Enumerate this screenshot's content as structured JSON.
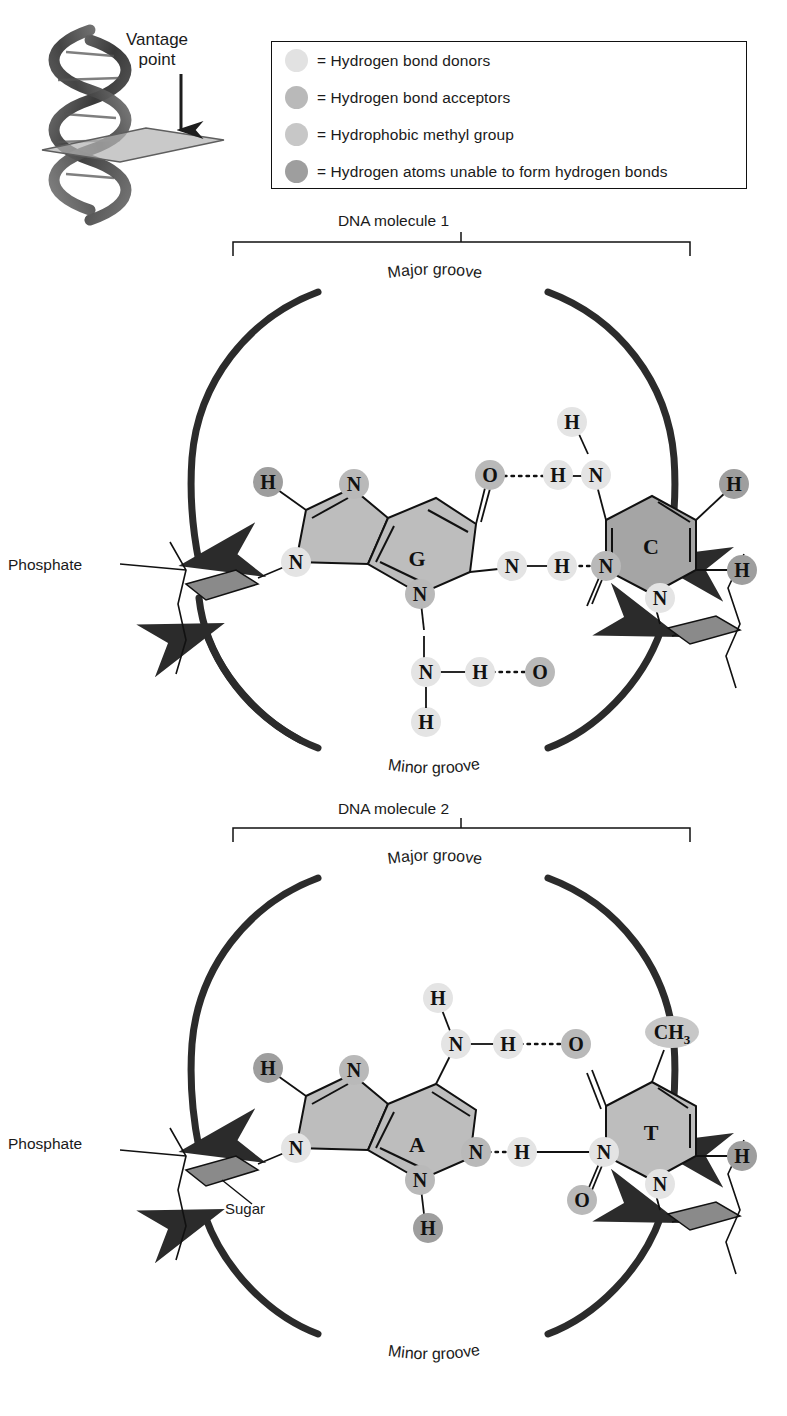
{
  "figure": {
    "type": "dna-base-pair-groove-diagram",
    "background": "#ffffff"
  },
  "vantage": {
    "label_line1": "Vantage",
    "label_line2": "point",
    "icon": "down-arrow-icon",
    "helix_icon": "dna-double-helix-icon",
    "plane_icon": "cross-section-plane-icon"
  },
  "legend": {
    "items": [
      {
        "label": "= Hydrogen bond donors",
        "color": "#e2e2e2",
        "name": "hydrogen-bond-donors"
      },
      {
        "label": "= Hydrogen bond acceptors",
        "color": "#b9b9b9",
        "name": "hydrogen-bond-acceptors"
      },
      {
        "label": "= Hydrophobic methyl group",
        "color": "#c7c7c7",
        "name": "hydrophobic-methyl-group"
      },
      {
        "label": "= Hydrogen atoms unable to form hydrogen bonds",
        "color": "#9e9e9e",
        "name": "hydrogen-atoms-no-bonds"
      }
    ]
  },
  "colors": {
    "donor": "#e4e4e4",
    "acceptor": "#b9b9b9",
    "methyl": "#c7c7c7",
    "nonbonding_h": "#9e9e9e",
    "purine_fill": "#bdbdbd",
    "pyrimidine_c_fill": "#a5a5a5",
    "pyrimidine_t_fill": "#bdbdbd",
    "sugar_fill": "#8a8a8a",
    "stroke": "#111111",
    "arrow": "#2b2b2b"
  },
  "molecules": [
    {
      "title": "DNA molecule 1",
      "major_groove_label": "Major groove",
      "minor_groove_label": "Minor groove",
      "phosphate_label": "Phosphate",
      "sugar_label": "",
      "base_pair": {
        "purine": {
          "letter": "G",
          "name": "guanine"
        },
        "pyrimidine": {
          "letter": "C",
          "name": "cytosine"
        },
        "hydrogen_bonds": 3
      },
      "atoms": [
        {
          "text": "H",
          "kind": "nonbonding_h"
        },
        {
          "text": "N",
          "kind": "acceptor"
        },
        {
          "text": "N",
          "kind": "donor"
        },
        {
          "text": "N",
          "kind": "acceptor"
        },
        {
          "text": "O",
          "kind": "acceptor"
        },
        {
          "text": "N",
          "kind": "donor"
        },
        {
          "text": "H",
          "kind": "donor"
        },
        {
          "text": "N",
          "kind": "donor"
        },
        {
          "text": "H",
          "kind": "donor"
        },
        {
          "text": "N",
          "kind": "acceptor"
        },
        {
          "text": "H",
          "kind": "nonbonding_h"
        },
        {
          "text": "H",
          "kind": "nonbonding_h"
        },
        {
          "text": "N",
          "kind": "donor"
        },
        {
          "text": "H",
          "kind": "donor"
        },
        {
          "text": "O",
          "kind": "acceptor"
        },
        {
          "text": "N",
          "kind": "donor"
        },
        {
          "text": "H",
          "kind": "donor"
        }
      ]
    },
    {
      "title": "DNA molecule 2",
      "major_groove_label": "Major groove",
      "minor_groove_label": "Minor groove",
      "phosphate_label": "Phosphate",
      "sugar_label": "Sugar",
      "base_pair": {
        "purine": {
          "letter": "A",
          "name": "adenine"
        },
        "pyrimidine": {
          "letter": "T",
          "name": "thymine"
        },
        "hydrogen_bonds": 2
      },
      "atoms": [
        {
          "text": "H",
          "kind": "nonbonding_h"
        },
        {
          "text": "N",
          "kind": "acceptor"
        },
        {
          "text": "N",
          "kind": "donor"
        },
        {
          "text": "N",
          "kind": "acceptor"
        },
        {
          "text": "H",
          "kind": "donor"
        },
        {
          "text": "N",
          "kind": "donor"
        },
        {
          "text": "H",
          "kind": "donor"
        },
        {
          "text": "O",
          "kind": "acceptor"
        },
        {
          "text": "N",
          "kind": "acceptor"
        },
        {
          "text": "H",
          "kind": "donor"
        },
        {
          "text": "N",
          "kind": "donor"
        },
        {
          "text": "CH3",
          "kind": "methyl"
        },
        {
          "text": "H",
          "kind": "nonbonding_h"
        },
        {
          "text": "H",
          "kind": "nonbonding_h"
        },
        {
          "text": "O",
          "kind": "acceptor"
        },
        {
          "text": "N",
          "kind": "donor"
        }
      ]
    }
  ]
}
